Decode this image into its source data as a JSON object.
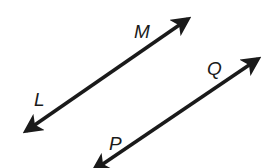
{
  "diagram": {
    "type": "parallel-lines",
    "background": "#ffffff",
    "stroke_color": "#1a1a1a",
    "lines": [
      {
        "name": "LM",
        "points": [
          {
            "label": "L",
            "label_x": 34,
            "label_y": 106
          },
          {
            "label": "M",
            "label_x": 134,
            "label_y": 38
          }
        ],
        "start": {
          "x": 26,
          "y": 131
        },
        "end": {
          "x": 188,
          "y": 19
        },
        "arrows": "both"
      },
      {
        "name": "PQ",
        "points": [
          {
            "label": "P",
            "label_x": 109,
            "label_y": 150
          },
          {
            "label": "Q",
            "label_x": 207,
            "label_y": 75
          }
        ],
        "start": {
          "x": 94,
          "y": 170
        },
        "end": {
          "x": 258,
          "y": 59
        },
        "arrows": "both"
      }
    ]
  }
}
